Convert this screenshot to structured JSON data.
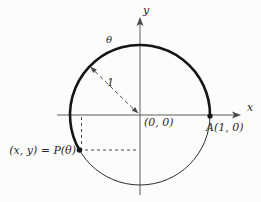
{
  "figure": {
    "colors": {
      "background": "#fcfcfa",
      "ink": "#151515",
      "axis": "#5a5a5a",
      "dashed": "#4a4a4a"
    },
    "labels": {
      "y_axis": "y",
      "x_axis": "x",
      "theta": "θ",
      "radius": "1",
      "origin": "(0, 0)",
      "point_a": "A(1, 0)",
      "point_p": "(x, y) = P(θ)"
    }
  }
}
